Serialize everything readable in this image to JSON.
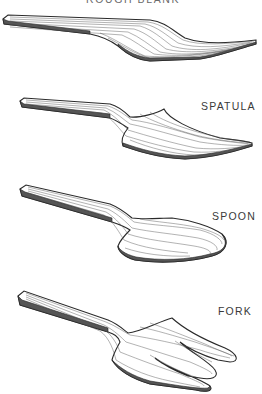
{
  "figure": {
    "labels": {
      "top": "ROUGH BLANK",
      "spatula": "SPATULA",
      "spoon": "SPOON",
      "fork": "FORK"
    },
    "items": [
      {
        "name": "rough-blank",
        "label": "ROUGH BLANK"
      },
      {
        "name": "spatula",
        "label": "SPATULA"
      },
      {
        "name": "spoon",
        "label": "SPOON"
      },
      {
        "name": "fork",
        "label": "FORK"
      }
    ],
    "colors": {
      "background": "#ffffff",
      "ink": "#2a2a2a",
      "label": "#3a3a3a"
    }
  }
}
